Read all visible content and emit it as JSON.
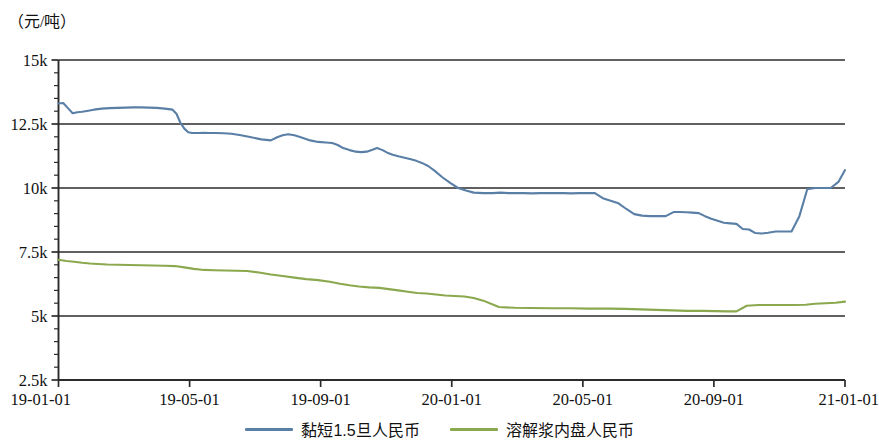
{
  "figure": {
    "unit_label": "（元/吨）"
  },
  "legend": {
    "position": "bottom-center",
    "entries": [
      {
        "label": "黏短1.5旦人民币",
        "color": "#5a7fa6"
      },
      {
        "label": "溶解浆内盘人民币",
        "color": "#8aa84d"
      }
    ]
  },
  "chart_data": {
    "type": "line",
    "title": "",
    "subtitle": "",
    "xlabel": "",
    "ylabel": "（元/吨）",
    "grid": true,
    "grid_axis": "y",
    "legend_position": "bottom-center",
    "ylim": [
      2500,
      15000
    ],
    "ytick_labels": [
      "15k",
      "12.5k",
      "10k",
      "7.5k",
      "5k",
      "2.5k"
    ],
    "ytick_values": [
      15000,
      12500,
      10000,
      7500,
      5000,
      2500
    ],
    "yminor_tick_step": 500,
    "xlim": [
      "19-01-01",
      "21-01-01"
    ],
    "xtick_labels": [
      "19-01-01",
      "19-05-01",
      "19-09-01",
      "20-01-01",
      "20-05-01",
      "20-09-01",
      "21-01-01"
    ],
    "xtick_values": [
      0,
      0.1667,
      0.3333,
      0.5,
      0.6667,
      0.8333,
      1.0
    ],
    "series": [
      {
        "name": "黏短1.5旦人民币",
        "color": "#5a7fa6",
        "x": [
          0.0,
          0.006,
          0.012,
          0.018,
          0.024,
          0.03,
          0.036,
          0.045,
          0.055,
          0.065,
          0.075,
          0.085,
          0.095,
          0.105,
          0.115,
          0.125,
          0.135,
          0.145,
          0.15,
          0.155,
          0.16,
          0.165,
          0.17,
          0.178,
          0.185,
          0.192,
          0.2,
          0.21,
          0.22,
          0.232,
          0.245,
          0.258,
          0.27,
          0.278,
          0.285,
          0.292,
          0.3,
          0.31,
          0.32,
          0.33,
          0.34,
          0.348,
          0.355,
          0.362,
          0.37,
          0.378,
          0.385,
          0.392,
          0.4,
          0.405,
          0.412,
          0.418,
          0.425,
          0.432,
          0.44,
          0.448,
          0.455,
          0.462,
          0.47,
          0.478,
          0.488,
          0.498,
          0.508,
          0.518,
          0.528,
          0.54,
          0.552,
          0.562,
          0.572,
          0.582,
          0.592,
          0.602,
          0.612,
          0.622,
          0.632,
          0.642,
          0.652,
          0.662,
          0.672,
          0.682,
          0.692,
          0.702,
          0.712,
          0.722,
          0.732,
          0.742,
          0.752,
          0.762,
          0.772,
          0.782,
          0.79,
          0.798,
          0.806,
          0.814,
          0.822,
          0.83,
          0.838,
          0.846,
          0.854,
          0.862,
          0.87,
          0.878,
          0.886,
          0.894,
          0.902,
          0.912,
          0.922,
          0.932,
          0.942,
          0.952,
          0.962,
          0.972,
          0.982,
          0.992,
          1.0
        ],
        "y": [
          13300,
          13320,
          13120,
          12920,
          12960,
          12980,
          13010,
          13060,
          13100,
          13120,
          13130,
          13140,
          13150,
          13150,
          13140,
          13130,
          13100,
          13060,
          12900,
          12550,
          12320,
          12180,
          12150,
          12150,
          12160,
          12150,
          12150,
          12140,
          12120,
          12060,
          11980,
          11900,
          11860,
          11980,
          12060,
          12100,
          12060,
          11960,
          11860,
          11800,
          11780,
          11760,
          11680,
          11560,
          11480,
          11420,
          11400,
          11420,
          11500,
          11560,
          11480,
          11380,
          11300,
          11240,
          11180,
          11120,
          11060,
          10980,
          10860,
          10680,
          10420,
          10200,
          10000,
          9900,
          9820,
          9800,
          9800,
          9820,
          9800,
          9800,
          9800,
          9790,
          9800,
          9800,
          9800,
          9800,
          9790,
          9800,
          9800,
          9800,
          9600,
          9500,
          9400,
          9180,
          8980,
          8920,
          8900,
          8900,
          8900,
          9060,
          9060,
          9050,
          9040,
          9020,
          8900,
          8800,
          8720,
          8640,
          8620,
          8600,
          8400,
          8380,
          8240,
          8220,
          8250,
          8300,
          8300,
          8300,
          8900,
          9950,
          10000,
          10000,
          10000,
          10250,
          10700
        ],
        "annotations": []
      },
      {
        "name": "溶解浆内盘人民币",
        "color": "#8aa84d",
        "x": [
          0.0,
          0.01,
          0.02,
          0.03,
          0.04,
          0.05,
          0.062,
          0.075,
          0.09,
          0.105,
          0.12,
          0.135,
          0.148,
          0.16,
          0.172,
          0.185,
          0.198,
          0.212,
          0.226,
          0.24,
          0.255,
          0.27,
          0.285,
          0.3,
          0.315,
          0.33,
          0.345,
          0.358,
          0.37,
          0.382,
          0.395,
          0.408,
          0.42,
          0.432,
          0.444,
          0.456,
          0.468,
          0.48,
          0.492,
          0.504,
          0.516,
          0.528,
          0.54,
          0.56,
          0.58,
          0.6,
          0.625,
          0.65,
          0.675,
          0.7,
          0.72,
          0.74,
          0.76,
          0.78,
          0.8,
          0.82,
          0.835,
          0.85,
          0.862,
          0.875,
          0.89,
          0.905,
          0.92,
          0.935,
          0.95,
          0.962,
          0.975,
          0.988,
          1.0
        ],
        "y": [
          7200,
          7150,
          7120,
          7080,
          7050,
          7030,
          7010,
          7000,
          6990,
          6980,
          6970,
          6960,
          6950,
          6900,
          6840,
          6800,
          6790,
          6780,
          6770,
          6760,
          6700,
          6620,
          6560,
          6500,
          6440,
          6400,
          6340,
          6260,
          6200,
          6150,
          6120,
          6100,
          6050,
          6000,
          5950,
          5900,
          5880,
          5840,
          5800,
          5780,
          5760,
          5700,
          5600,
          5350,
          5320,
          5310,
          5300,
          5300,
          5290,
          5290,
          5280,
          5260,
          5240,
          5220,
          5200,
          5200,
          5190,
          5180,
          5180,
          5400,
          5430,
          5430,
          5430,
          5430,
          5440,
          5480,
          5500,
          5520,
          5560
        ],
        "annotations": []
      }
    ]
  }
}
